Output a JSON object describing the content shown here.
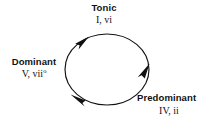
{
  "diagram": {
    "type": "harmonic-function-cycle",
    "background_color": "#ffffff",
    "stroke_color": "#111111",
    "direction": "clockwise",
    "cycle": {
      "center_x": 107,
      "center_y": 69,
      "radius_x": 42,
      "radius_y": 35
    },
    "nodes": [
      {
        "id": "tonic",
        "name": "Tonic",
        "chords": "I, vi",
        "position": "top"
      },
      {
        "id": "dominant",
        "name": "Dominant",
        "chords_prefix": "V, vii",
        "chords_suffix": "o",
        "position": "left"
      },
      {
        "id": "predominant",
        "name": "Predominant",
        "chords": "IV, ii",
        "position": "bottom-right"
      }
    ],
    "arrowheads": [
      {
        "id": "arrow-to-tonic",
        "location": "upper-left",
        "points": "up-right"
      },
      {
        "id": "arrow-to-predominant",
        "location": "right",
        "points": "down"
      },
      {
        "id": "arrow-to-dominant",
        "location": "lower-left",
        "points": "left"
      }
    ]
  }
}
